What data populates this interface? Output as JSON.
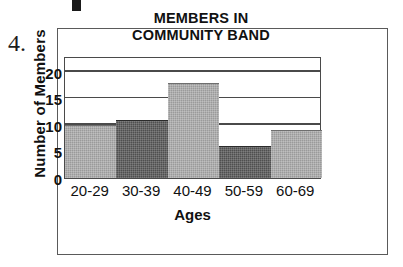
{
  "exercise": {
    "number_label": "4."
  },
  "chart_data": {
    "type": "bar",
    "title": "MEMBERS IN COMMUNITY BAND",
    "title_lines": [
      "MEMBERS IN",
      "COMMUNITY BAND"
    ],
    "categories": [
      "20-29",
      "30-39",
      "40-49",
      "50-59",
      "60-69"
    ],
    "values": [
      10,
      11,
      18,
      6,
      9
    ],
    "bar_shades": [
      "light",
      "dark",
      "light",
      "dark",
      "light"
    ],
    "xlabel": "Ages",
    "ylabel": "Number of Members",
    "ylim": [
      0,
      23
    ],
    "yticks": [
      0,
      5,
      10,
      15,
      20
    ],
    "ytick_labels": [
      "0",
      "5",
      "10",
      "15",
      "20"
    ],
    "gridlines": [
      5,
      10,
      15,
      20
    ],
    "grid": true,
    "legend": false,
    "colors": {
      "bar_light": "#9a9a9a",
      "bar_dark": "#4f4f4f",
      "axis": "#4a4a4a",
      "text": "#111111",
      "frame": "#5a5a5a",
      "background": "#ffffff"
    }
  }
}
